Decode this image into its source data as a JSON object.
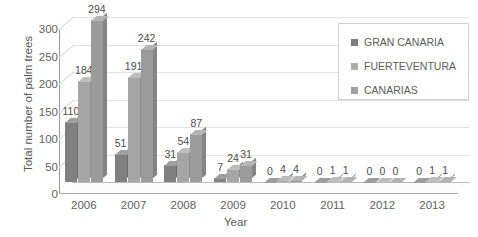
{
  "chart_data": {
    "type": "bar",
    "title": "",
    "xlabel": "Year",
    "ylabel": "Total number of palm trees",
    "categories": [
      "2006",
      "2007",
      "2008",
      "2009",
      "2010",
      "2011",
      "2012",
      "2013"
    ],
    "series": [
      {
        "name": "GRAN CANARIA",
        "values": [
          110,
          51,
          31,
          7,
          0,
          0,
          0,
          0
        ],
        "color": "#808080"
      },
      {
        "name": "FUERTEVENTURA",
        "values": [
          184,
          191,
          54,
          24,
          4,
          1,
          0,
          1
        ],
        "color": "#a6a6a6"
      },
      {
        "name": "CANARIAS",
        "values": [
          294,
          242,
          87,
          31,
          4,
          1,
          0,
          1
        ],
        "color": "#9b9b9b"
      }
    ],
    "ylim": [
      0,
      300
    ],
    "yticks": [
      "0",
      "50",
      "100",
      "150",
      "200",
      "250",
      "300"
    ],
    "ytick_values": [
      0,
      50,
      100,
      150,
      200,
      250,
      300
    ],
    "grid": true,
    "legend_position": "top-right",
    "data_labels": true,
    "style": "3d-clustered-column"
  },
  "legend": {
    "items": [
      {
        "label": "GRAN CANARIA",
        "swatch": "#7d7d7d"
      },
      {
        "label": "FUERTEVENTURA",
        "swatch": "#adadad"
      },
      {
        "label": "CANARIAS",
        "swatch": "#a0a0a0"
      }
    ]
  },
  "colors": {
    "background": "#ffffff",
    "gridline": "#e2e2e2",
    "axis": "#a8a8a8",
    "text": "#5f5f5f"
  }
}
